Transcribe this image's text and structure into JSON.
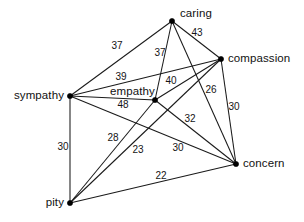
{
  "graph": {
    "title": "weighted similarity graph of emotion terms",
    "background_color": "#ffffff",
    "edge_color": "#1a1a1a",
    "node_color": "#000000",
    "text_color": "#111111",
    "nodes": [
      {
        "id": "caring",
        "label": "caring",
        "x": 172,
        "y": 21,
        "label_x": 180,
        "label_y": 14,
        "anchor": "start"
      },
      {
        "id": "compassion",
        "label": "compassion",
        "x": 221,
        "y": 59,
        "label_x": 228,
        "label_y": 59,
        "anchor": "start"
      },
      {
        "id": "sympathy",
        "label": "sympathy",
        "x": 70,
        "y": 96,
        "label_x": 64,
        "label_y": 96,
        "anchor": "end"
      },
      {
        "id": "empathy",
        "label": "empathy",
        "x": 155,
        "y": 100,
        "label_x": 110,
        "label_y": 92,
        "anchor": "start"
      },
      {
        "id": "concern",
        "label": "concern",
        "x": 236,
        "y": 164,
        "label_x": 243,
        "label_y": 164,
        "anchor": "start"
      },
      {
        "id": "pity",
        "label": "pity",
        "x": 70,
        "y": 203,
        "label_x": 64,
        "label_y": 203,
        "anchor": "end"
      }
    ],
    "edges": [
      {
        "source": "caring",
        "target": "sympathy",
        "weight": "37",
        "label_x": 117,
        "label_y": 46
      },
      {
        "source": "caring",
        "target": "empathy",
        "weight": "37",
        "label_x": 160,
        "label_y": 53
      },
      {
        "source": "caring",
        "target": "compassion",
        "weight": "43",
        "label_x": 197,
        "label_y": 33
      },
      {
        "source": "caring",
        "target": "concern",
        "weight": "26",
        "label_x": 211,
        "label_y": 90
      },
      {
        "source": "sympathy",
        "target": "compassion",
        "weight": "39",
        "label_x": 121,
        "label_y": 77
      },
      {
        "source": "sympathy",
        "target": "empathy",
        "weight": "48",
        "label_x": 123,
        "label_y": 105
      },
      {
        "source": "sympathy",
        "target": "concern",
        "weight": "30",
        "label_x": 178,
        "label_y": 148
      },
      {
        "source": "sympathy",
        "target": "pity",
        "weight": "30",
        "label_x": 63,
        "label_y": 147
      },
      {
        "source": "compassion",
        "target": "empathy",
        "weight": "40",
        "label_x": 171,
        "label_y": 81
      },
      {
        "source": "compassion",
        "target": "concern",
        "weight": "30",
        "label_x": 234,
        "label_y": 107
      },
      {
        "source": "compassion",
        "target": "pity",
        "weight": "28",
        "label_x": 113,
        "label_y": 138
      },
      {
        "source": "empathy",
        "target": "concern",
        "weight": "32",
        "label_x": 190,
        "label_y": 119
      },
      {
        "source": "empathy",
        "target": "pity",
        "weight": "23",
        "label_x": 138,
        "label_y": 150
      },
      {
        "source": "concern",
        "target": "pity",
        "weight": "22",
        "label_x": 161,
        "label_y": 176
      }
    ]
  }
}
